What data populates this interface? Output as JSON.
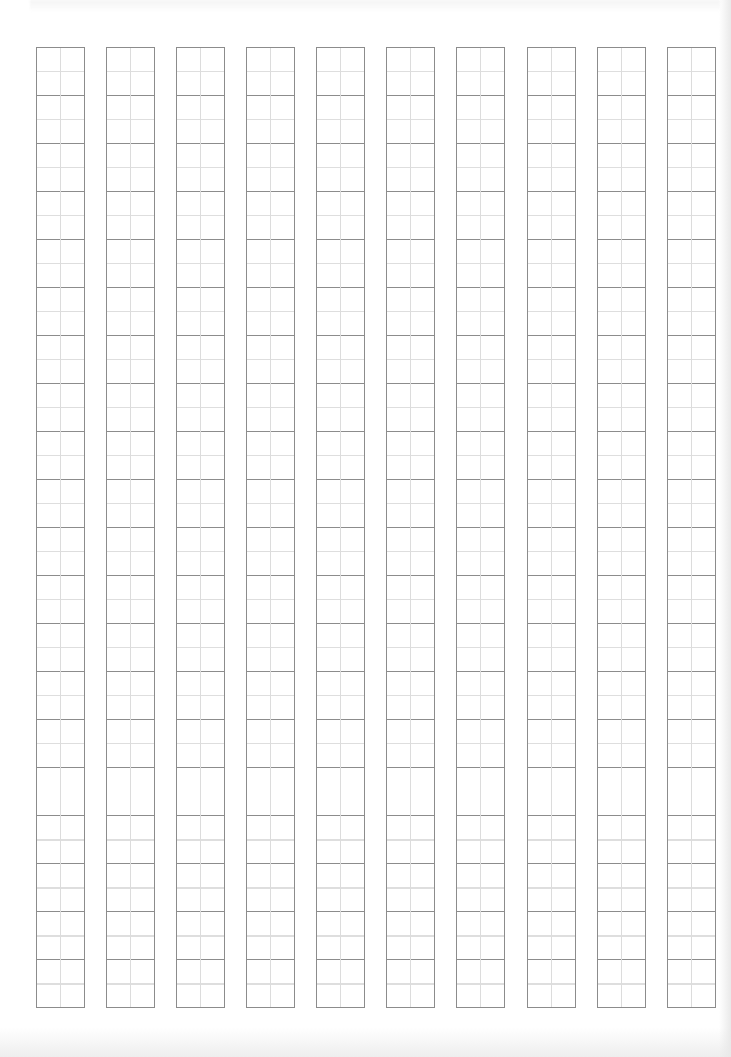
{
  "document": {
    "type": "blank-writing-grid-sheet",
    "ghost_text_top": "",
    "grid": {
      "columns": 10,
      "cells_per_column": 20,
      "cell_subdivisions": "quadrant (center vertical + center horizontal guide)",
      "column_left_positions_px": [
        36,
        106,
        176,
        246,
        316,
        386,
        456,
        527,
        597,
        667
      ],
      "column_width_px": 48,
      "cell_height_px": 48,
      "grid_top_px": 47,
      "grid_bottom_px": 1006
    },
    "colors": {
      "background": "#ffffff",
      "major_line": "#8c8c8c",
      "minor_guide": "#dcdcdc",
      "edge_shadow": "#e8e8e8"
    }
  }
}
